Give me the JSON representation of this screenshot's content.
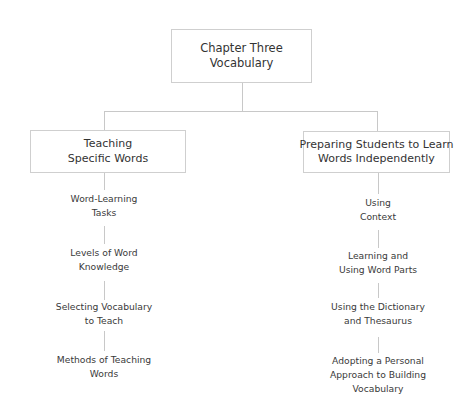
{
  "diagram": {
    "root": {
      "lines": [
        "Chapter Three",
        "Vocabulary"
      ]
    },
    "branches": [
      {
        "lines": [
          "Teaching",
          "Specific Words"
        ],
        "children": [
          {
            "lines": [
              "Word-Learning",
              "Tasks"
            ]
          },
          {
            "lines": [
              "Levels of Word",
              "Knowledge"
            ]
          },
          {
            "lines": [
              "Selecting Vocabulary",
              "to Teach"
            ]
          },
          {
            "lines": [
              "Methods of Teaching",
              "Words"
            ]
          }
        ]
      },
      {
        "lines": [
          "Preparing Students to Learn",
          "Words Independently"
        ],
        "children": [
          {
            "lines": [
              "Using",
              "Context"
            ]
          },
          {
            "lines": [
              "Learning and",
              "Using Word Parts"
            ]
          },
          {
            "lines": [
              "Using the Dictionary",
              "and Thesaurus"
            ]
          },
          {
            "lines": [
              "Adopting a Personal",
              "Approach to Building",
              "Vocabulary"
            ]
          }
        ]
      }
    ],
    "colors": {
      "border": "#cfcfcf",
      "connector": "#c8c8c8",
      "text": "#333333"
    }
  }
}
